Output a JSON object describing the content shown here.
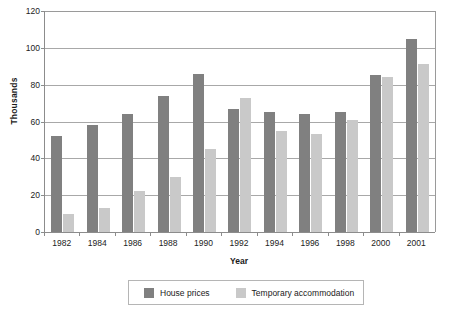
{
  "chart_data": {
    "type": "bar",
    "title": "",
    "xlabel": "Year",
    "ylabel": "Thousands",
    "categories": [
      "1982",
      "1984",
      "1986",
      "1988",
      "1990",
      "1992",
      "1994",
      "1996",
      "1998",
      "2000",
      "2001"
    ],
    "series": [
      {
        "name": "House prices",
        "color": "#808080",
        "values": [
          52,
          58,
          64,
          74,
          86,
          67,
          65,
          64,
          65,
          85,
          105
        ]
      },
      {
        "name": "Temporary accommodation",
        "color": "#c9c9c9",
        "values": [
          10,
          13,
          22,
          30,
          45,
          73,
          55,
          53,
          61,
          84,
          91
        ]
      }
    ],
    "ylim": [
      0,
      120
    ],
    "y_ticks": [
      0,
      20,
      40,
      60,
      80,
      100,
      120
    ],
    "y_tick_labels": [
      "0",
      "20",
      "40",
      "60",
      "80",
      "100",
      "120"
    ],
    "grid": true,
    "legend_position": "bottom-center",
    "bar_orientation": "vertical"
  },
  "legend": {
    "entries": [
      {
        "label": "House prices",
        "swatch": "dark-gray-swatch"
      },
      {
        "label": "Temporary accommodation",
        "swatch": "light-gray-swatch"
      }
    ]
  },
  "colors": {
    "series_house_prices": "#808080",
    "series_temporary_accommodation": "#c9c9c9",
    "gridline": "#a8a8a8",
    "axis": "#8c8c8c",
    "background": "#ffffff",
    "text": "#1a1a1a"
  }
}
